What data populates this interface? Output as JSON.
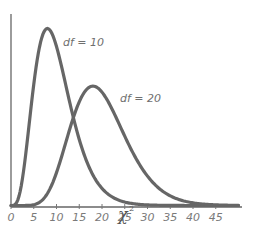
{
  "chart_data": {
    "type": "line",
    "title": "",
    "xlabel": "χ²",
    "ylabel": "",
    "xlim": [
      0,
      50
    ],
    "xticks": [
      0,
      5,
      10,
      15,
      20,
      25,
      30,
      35,
      40,
      45
    ],
    "xtick_labels": [
      "0",
      "5",
      "10",
      "15",
      "20",
      "25",
      "30",
      "35",
      "40",
      "45"
    ],
    "grid": false,
    "legend": "inline labels",
    "series": [
      {
        "name": "df = 10",
        "df": 10,
        "color": "#666666",
        "peak_x": 8,
        "label": "df = 10"
      },
      {
        "name": "df = 20",
        "df": 20,
        "color": "#666666",
        "peak_x": 18,
        "label": "df = 20"
      }
    ]
  },
  "labels": {
    "series1": "df = 10",
    "series2": "df = 20",
    "xaxis": "χ",
    "xaxis_sup": "2"
  },
  "ticks": [
    "0",
    "5",
    "10",
    "15",
    "20",
    "25",
    "30",
    "35",
    "40",
    "45"
  ]
}
